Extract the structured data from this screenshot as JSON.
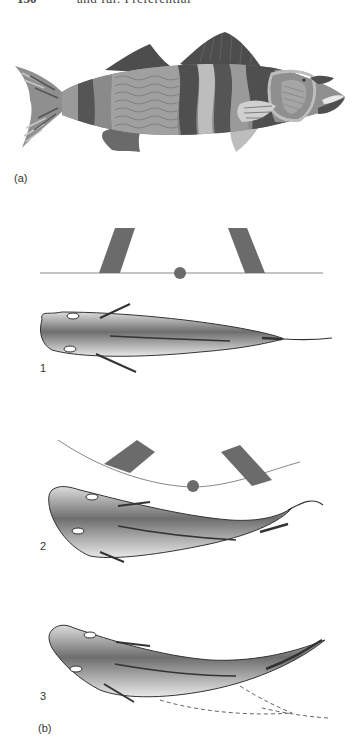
{
  "page": {
    "page_number": "150",
    "running_header": "and fur. Preferential"
  },
  "figure": {
    "panel_a_label": "(a)",
    "panel_b_label": "(b)",
    "stage_labels": [
      "1",
      "2",
      "3"
    ],
    "colors": {
      "dark_band": "#555555",
      "mid_band": "#8a8a8a",
      "light_band": "#bdbdbd",
      "fin_dark": "#4d4d4d",
      "fin_light": "#c9c9c9",
      "paddle": "#6b6b6b",
      "pivot": "#6b6b6b",
      "line": "#888888",
      "outline": "#333333"
    }
  }
}
